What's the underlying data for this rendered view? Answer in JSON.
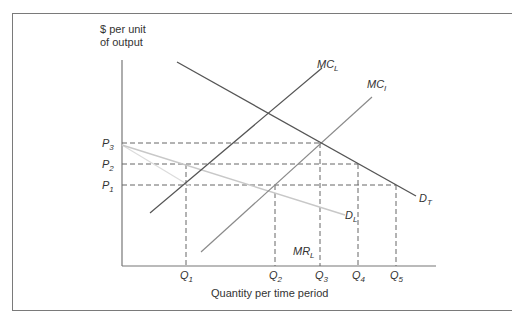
{
  "diagram": {
    "type": "economics-demand-supply",
    "y_axis_label_line1": "$ per unit",
    "y_axis_label_line2": "of output",
    "x_axis_label": "Quantity per time period",
    "colors": {
      "dark_line": "#555555",
      "mid_line": "#8a8a8a",
      "light_line": "#c8c8c8",
      "dash": "#666666",
      "axis": "#777777",
      "text": "#333333"
    },
    "curves": [
      {
        "id": "D_T",
        "label": "D",
        "sub": "T"
      },
      {
        "id": "MC_L",
        "label": "MC",
        "sub": "L"
      },
      {
        "id": "MC_I",
        "label": "MC",
        "sub": "I"
      },
      {
        "id": "D_L",
        "label": "D",
        "sub": "L"
      },
      {
        "id": "MR_L",
        "label": "MR",
        "sub": "L"
      }
    ],
    "price_levels": [
      {
        "label": "P",
        "sub": "3"
      },
      {
        "label": "P",
        "sub": "2"
      },
      {
        "label": "P",
        "sub": "1"
      }
    ],
    "quantity_levels": [
      {
        "label": "Q",
        "sub": "1"
      },
      {
        "label": "Q",
        "sub": "2"
      },
      {
        "label": "Q",
        "sub": "3"
      },
      {
        "label": "Q",
        "sub": "4"
      },
      {
        "label": "Q",
        "sub": "5"
      }
    ]
  }
}
